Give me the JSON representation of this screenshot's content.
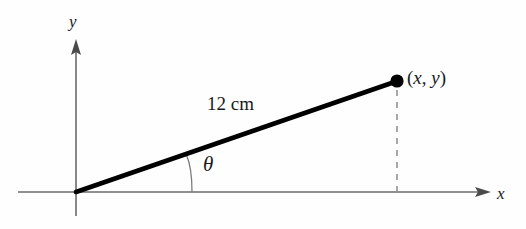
{
  "figure": {
    "background_color": "#fefefe",
    "line_color": "#000000",
    "axis_color": "#6b6b6b",
    "dashed_color": "#8a8a8a",
    "labels": {
      "y_axis": "y",
      "x_axis": "x",
      "segment_length": "12 cm",
      "angle": "θ",
      "point_open_paren": "(",
      "point_x": "x",
      "point_comma": ", ",
      "point_y": "y",
      "point_close_paren": ")",
      "point_full": "(x, y)"
    },
    "geometry": {
      "origin": [
        76,
        192
      ],
      "terminal_point": [
        397,
        81
      ],
      "x_axis_start": [
        18,
        192
      ],
      "x_axis_arrow_tip": [
        491,
        192
      ],
      "y_axis_bottom": [
        76,
        216
      ],
      "y_axis_arrow_tip": [
        76,
        39
      ],
      "dashed_drop_from": [
        397,
        90
      ],
      "dashed_drop_to": [
        397,
        191
      ],
      "angle_arc_start": [
        192,
        192
      ],
      "angle_arc_end": [
        186,
        155
      ],
      "segment_length_value": 12,
      "segment_length_unit": "cm",
      "segment_stroke_width": 4.5,
      "axis_stroke_width": 1.6,
      "dot_radius": 6.5
    }
  }
}
